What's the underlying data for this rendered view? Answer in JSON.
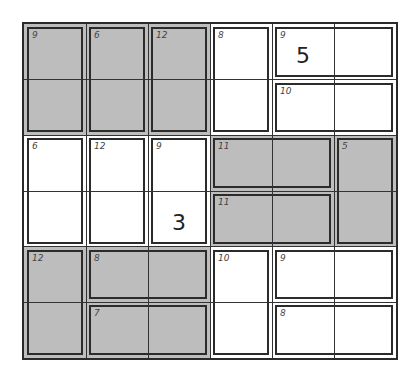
{
  "puzzle": {
    "type": "killer-sudoku",
    "rows": 6,
    "cols": 6,
    "colors": {
      "gray": "#bdbdbd",
      "white": "#ffffff",
      "line": "#2b2b2b"
    },
    "cages": [
      {
        "sum": "9",
        "shade": "gray",
        "r": 0,
        "c": 0,
        "rs": 2,
        "cs": 1
      },
      {
        "sum": "6",
        "shade": "gray",
        "r": 0,
        "c": 1,
        "rs": 2,
        "cs": 1
      },
      {
        "sum": "12",
        "shade": "gray",
        "r": 0,
        "c": 2,
        "rs": 2,
        "cs": 1
      },
      {
        "sum": "8",
        "shade": "white",
        "r": 0,
        "c": 3,
        "rs": 2,
        "cs": 1
      },
      {
        "sum": "9",
        "shade": "white",
        "r": 0,
        "c": 4,
        "rs": 1,
        "cs": 2
      },
      {
        "sum": "10",
        "shade": "white",
        "r": 1,
        "c": 4,
        "rs": 1,
        "cs": 2
      },
      {
        "sum": "6",
        "shade": "white",
        "r": 2,
        "c": 0,
        "rs": 2,
        "cs": 1
      },
      {
        "sum": "12",
        "shade": "white",
        "r": 2,
        "c": 1,
        "rs": 2,
        "cs": 1
      },
      {
        "sum": "9",
        "shade": "white",
        "r": 2,
        "c": 2,
        "rs": 2,
        "cs": 1
      },
      {
        "sum": "11",
        "shade": "gray",
        "r": 2,
        "c": 3,
        "rs": 1,
        "cs": 2
      },
      {
        "sum": "11",
        "shade": "gray",
        "r": 3,
        "c": 3,
        "rs": 1,
        "cs": 2
      },
      {
        "sum": "5",
        "shade": "gray",
        "r": 2,
        "c": 5,
        "rs": 2,
        "cs": 1
      },
      {
        "sum": "12",
        "shade": "gray",
        "r": 4,
        "c": 0,
        "rs": 2,
        "cs": 1
      },
      {
        "sum": "8",
        "shade": "gray",
        "r": 4,
        "c": 1,
        "rs": 1,
        "cs": 2
      },
      {
        "sum": "7",
        "shade": "gray",
        "r": 5,
        "c": 1,
        "rs": 1,
        "cs": 2
      },
      {
        "sum": "10",
        "shade": "white",
        "r": 4,
        "c": 3,
        "rs": 2,
        "cs": 1
      },
      {
        "sum": "9",
        "shade": "white",
        "r": 4,
        "c": 4,
        "rs": 1,
        "cs": 2
      },
      {
        "sum": "8",
        "shade": "white",
        "r": 5,
        "c": 4,
        "rs": 1,
        "cs": 2
      }
    ],
    "givens": [
      {
        "r": 0,
        "c": 4,
        "value": "5"
      },
      {
        "r": 3,
        "c": 2,
        "value": "3"
      }
    ]
  }
}
